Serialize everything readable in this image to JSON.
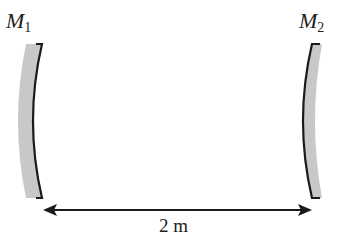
{
  "diagram": {
    "type": "two concave mirrors facing each other",
    "mirrors": [
      {
        "id": "M1",
        "symbol": "M",
        "subscript": "1",
        "position": "left",
        "concave_facing": "right"
      },
      {
        "id": "M2",
        "symbol": "M",
        "subscript": "2",
        "position": "right",
        "concave_facing": "left"
      }
    ],
    "separation": {
      "label": "2 m",
      "arrow": "double-headed"
    },
    "colors": {
      "mirror_fill": "#c8c8c8",
      "mirror_edge": "#1a1a1a",
      "arrow": "#1a1a1a",
      "text": "#222222"
    }
  }
}
